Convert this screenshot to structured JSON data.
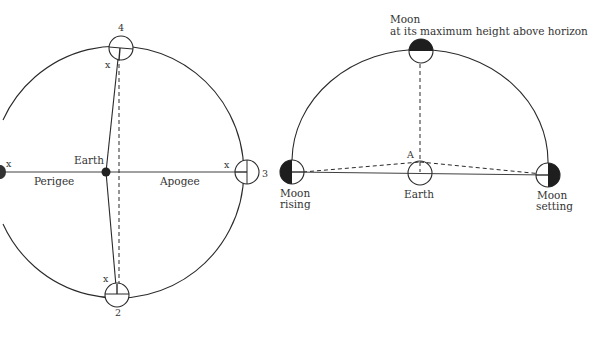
{
  "figure": {
    "left_diagram": {
      "title": "Moon orbit around Earth: perigee and apogee",
      "earth_label": "Earth",
      "perigee_label": "Perigee",
      "apogee_label": "Apogee",
      "position_labels": [
        "4",
        "3",
        "2"
      ],
      "marker_label": "x"
    },
    "right_diagram": {
      "title": "Moon height above horizon",
      "top_moon_label_line1": "Moon",
      "top_moon_label_line2": "at its maximum height above horizon",
      "point_label": "A",
      "earth_label": "Earth",
      "rising_label_line1": "Moon",
      "rising_label_line2": "rising",
      "setting_label_line1": "Moon",
      "setting_label_line2": "setting"
    },
    "colors": {
      "ink": "#2a2a2a",
      "background": "#ffffff"
    }
  }
}
